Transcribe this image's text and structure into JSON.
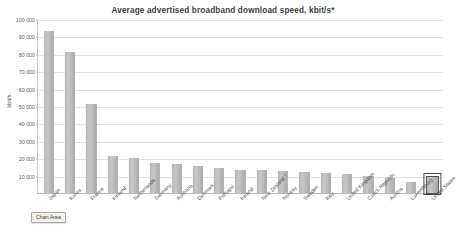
{
  "chart_data": {
    "type": "bar",
    "title": "Average advertised broadband download speed, kbit/s*",
    "xlabel": "",
    "ylabel": "kbit/s",
    "ylim": [
      0,
      100000
    ],
    "grid": true,
    "legend": false,
    "y_ticks": [
      {
        "value": 100000,
        "label": "100 000"
      },
      {
        "value": 90000,
        "label": "90 000"
      },
      {
        "value": 80000,
        "label": "80 000"
      },
      {
        "value": 70000,
        "label": "70 000"
      },
      {
        "value": 60000,
        "label": "60 000"
      },
      {
        "value": 50000,
        "label": "50 000"
      },
      {
        "value": 40000,
        "label": "40 000"
      },
      {
        "value": 30000,
        "label": "30 000"
      },
      {
        "value": 20000,
        "label": "20 000"
      },
      {
        "value": 10000,
        "label": "10 000"
      }
    ],
    "categories": [
      "Japan",
      "Korea",
      "France",
      "Finland",
      "Netherlands",
      "Germany",
      "Australia",
      "Denmark",
      "Portugal",
      "Ireland",
      "New Zealand *",
      "Norway",
      "Sweden",
      "Italy",
      "United Kingdom",
      "Czech Republic",
      "Austria",
      "Luxembourg",
      "United States"
    ],
    "values": [
      93000,
      81000,
      51000,
      21000,
      20000,
      17500,
      16500,
      15500,
      14500,
      13500,
      13000,
      12500,
      12000,
      11500,
      11000,
      9500,
      8500,
      6500,
      9000
    ],
    "selected_category": "United States"
  },
  "tooltip": {
    "label": "Chart Area"
  }
}
